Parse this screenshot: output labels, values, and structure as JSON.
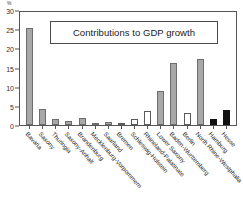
{
  "chart_data": {
    "type": "bar",
    "title": "Contributions to GDP growth",
    "xlabel": "",
    "ylabel": "%",
    "unit_label": "%",
    "ylim": [
      0,
      30
    ],
    "yticks": [
      0,
      5,
      10,
      15,
      20,
      25,
      30
    ],
    "ytick_labels": [
      "0",
      "5",
      "10",
      "15",
      "20",
      "25",
      "30"
    ],
    "grid": false,
    "legend": "none",
    "categories": [
      "Bavaria",
      "Saxony",
      "Thuringia",
      "Saxony-Anhalt",
      "Brandenburg",
      "Mecklenburg-Vorpommern",
      "Saarland",
      "Bremen",
      "Schleswig-Holstein",
      "Rhineland-Palatinate",
      "Lower Saxony",
      "Baden-Wurttemberg",
      "Berlin",
      "North Rhine-Westphalia",
      "Hamburg",
      "Hesse"
    ],
    "values": [
      25.7,
      4.3,
      1.7,
      1.1,
      1.9,
      0.5,
      0.7,
      0.4,
      1.7,
      3.8,
      9.0,
      16.5,
      3.1,
      17.6,
      1.7,
      3.9
    ],
    "bar_styles": [
      "gray",
      "gray",
      "gray",
      "gray",
      "gray",
      "gray",
      "gray",
      "white",
      "white",
      "white",
      "gray",
      "gray",
      "white",
      "gray",
      "black",
      "black"
    ],
    "colors": {
      "gray_fill": "#a8a8a8",
      "gray_edge": "#6d6d6d",
      "white_fill": "#ffffff",
      "white_edge": "#5a5a5a",
      "black_fill": "#111111",
      "axis": "#555555",
      "text": "#1f1f1f",
      "background": "#ffffff"
    }
  }
}
